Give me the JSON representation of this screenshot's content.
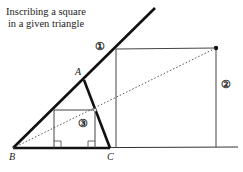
{
  "title": {
    "line1": "Inscribing a square",
    "line2": "in a given triangle"
  },
  "points": {
    "A": "A",
    "B": "B",
    "C": "C"
  },
  "markers": {
    "one": "①",
    "two": "②",
    "three": "③"
  }
}
